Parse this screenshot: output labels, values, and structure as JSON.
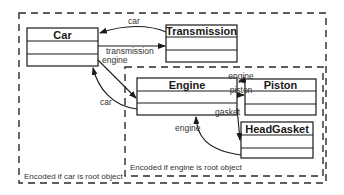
{
  "diagram": {
    "type": "uml-class-object-graph",
    "regions": {
      "outer": {
        "label": "Encoded if car is root object"
      },
      "inner": {
        "label": "Encoded if engine is root object"
      }
    },
    "classes": {
      "car": {
        "name": "Car"
      },
      "transmission": {
        "name": "Transmission"
      },
      "engine": {
        "name": "Engine"
      },
      "piston": {
        "name": "Piston"
      },
      "headgasket": {
        "name": "HeadGasket"
      }
    },
    "edges": {
      "transmission_to_car": {
        "label": "car",
        "from": "Transmission",
        "to": "Car"
      },
      "car_to_transmission": {
        "label": "transmission",
        "from": "Car",
        "to": "Transmission"
      },
      "car_to_engine": {
        "label": "engine",
        "from": "Car",
        "to": "Engine"
      },
      "engine_to_car": {
        "label": "car",
        "from": "Engine",
        "to": "Car"
      },
      "piston_to_engine": {
        "label": "engine",
        "from": "Piston",
        "to": "Engine"
      },
      "engine_to_piston": {
        "label": "piston",
        "from": "Engine",
        "to": "Piston"
      },
      "engine_to_headgasket": {
        "label": "gasket",
        "from": "Engine",
        "to": "HeadGasket"
      },
      "headgasket_to_engine": {
        "label": "engine",
        "from": "HeadGasket",
        "to": "Engine"
      }
    }
  }
}
